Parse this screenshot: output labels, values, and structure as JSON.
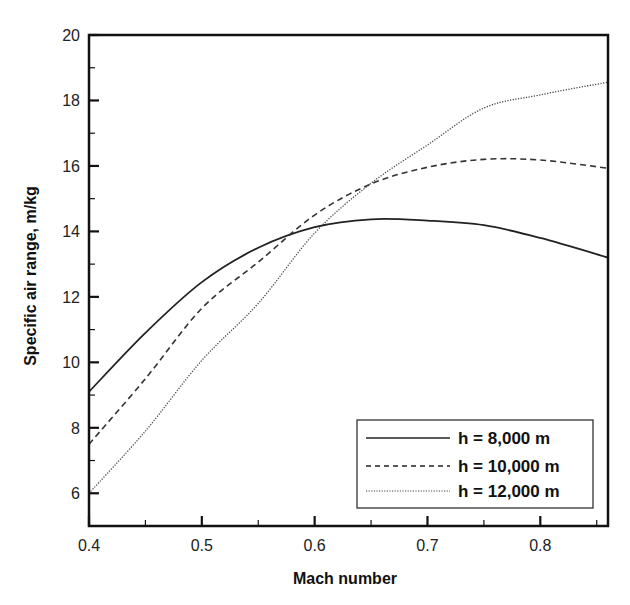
{
  "chart_data": {
    "type": "line",
    "title": "",
    "xlabel": "Mach number",
    "ylabel": "Specific air range, m/kg",
    "xlim": [
      0.4,
      0.86
    ],
    "ylim": [
      5,
      20
    ],
    "xticks": [
      0.4,
      0.5,
      0.6,
      0.7,
      0.8
    ],
    "xtick_labels": [
      "0.4",
      "0.5",
      "0.6",
      "0.7",
      "0.8"
    ],
    "xminor": [
      0.45,
      0.55,
      0.65,
      0.75,
      0.85
    ],
    "yticks": [
      6,
      8,
      10,
      12,
      14,
      16,
      18,
      20
    ],
    "ytick_labels": [
      "6",
      "8",
      "10",
      "12",
      "14",
      "16",
      "18",
      "20"
    ],
    "yminor": [
      7,
      9,
      11,
      13,
      15,
      17,
      19
    ],
    "grid": false,
    "legend_position": "lower right",
    "x": [
      0.4,
      0.45,
      0.5,
      0.55,
      0.6,
      0.65,
      0.7,
      0.75,
      0.8,
      0.86
    ],
    "series": [
      {
        "name": "h = 8,000 m",
        "style": "solid",
        "values": [
          9.1,
          10.9,
          12.45,
          13.5,
          14.13,
          14.37,
          14.33,
          14.19,
          13.8,
          13.2
        ]
      },
      {
        "name": "h = 10,000 m",
        "style": "dashed",
        "values": [
          7.5,
          9.5,
          11.65,
          13.06,
          14.5,
          15.45,
          15.96,
          16.2,
          16.18,
          15.93
        ]
      },
      {
        "name": "h = 12,000 m",
        "style": "dotted",
        "values": [
          6.0,
          7.9,
          10.06,
          11.8,
          13.95,
          15.47,
          16.64,
          17.77,
          18.17,
          18.56
        ]
      }
    ]
  }
}
